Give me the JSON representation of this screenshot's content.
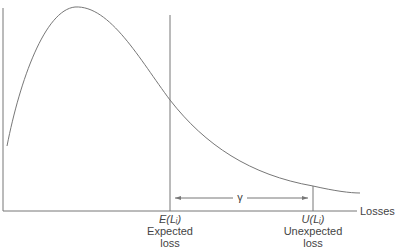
{
  "diagram": {
    "x_axis_label": "Losses",
    "gamma_label": "γ",
    "expected": {
      "symbol": "E(Lᵢ)",
      "line1": "Expected",
      "line2": "loss"
    },
    "unexpected": {
      "symbol": "U(Lᵢ)",
      "line1": "Unexpected",
      "line2": "loss"
    },
    "line_color": "#666666"
  }
}
